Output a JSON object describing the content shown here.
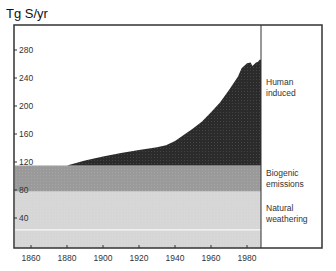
{
  "chart_data": {
    "type": "area",
    "title": "",
    "xlabel": "",
    "ylabel": "Tg S/yr",
    "xlim": [
      1851,
      1988
    ],
    "ylim": [
      0,
      300
    ],
    "x_ticks": [
      1860,
      1880,
      1900,
      1920,
      1940,
      1960,
      1980
    ],
    "y_ticks": [
      40,
      80,
      120,
      160,
      200,
      240,
      280
    ],
    "grid": false,
    "legend_position": "right, inline labels",
    "stacked": true,
    "series": [
      {
        "name": "Natural weathering",
        "color": "#d6d6d6",
        "x": [
          1851,
          1988
        ],
        "base": [
          0,
          0
        ],
        "top": [
          78,
          78
        ]
      },
      {
        "name": "Biogenic emissions",
        "color": "#9a9a9a",
        "x": [
          1851,
          1988
        ],
        "base": [
          78,
          78
        ],
        "top": [
          115,
          115
        ]
      },
      {
        "name": "Human induced",
        "color": "#2b2b2b",
        "x": [
          1880,
          1890,
          1900,
          1910,
          1920,
          1930,
          1935,
          1940,
          1950,
          1955,
          1960,
          1965,
          1970,
          1975,
          1977,
          1980,
          1982,
          1983,
          1985,
          1986,
          1987
        ],
        "total": [
          115,
          122,
          128,
          133,
          137,
          141,
          144,
          150,
          168,
          178,
          191,
          205,
          223,
          242,
          254,
          261,
          262,
          257,
          262,
          263,
          266
        ]
      }
    ],
    "annotations": [
      {
        "text": "Human induced",
        "lines": [
          "Human",
          "induced"
        ]
      },
      {
        "text": "Biogenic emissions",
        "lines": [
          "Biogenic",
          "emissions"
        ]
      },
      {
        "text": "Natural weathering",
        "lines": [
          "Natural",
          "weathering"
        ]
      }
    ],
    "reference_line": {
      "y": 23,
      "color": "#ffffff"
    }
  },
  "labels": {
    "y_unit": "Tg S/yr",
    "human_1": "Human",
    "human_2": "induced",
    "bio_1": "Biogenic",
    "bio_2": "emissions",
    "nat_1": "Natural",
    "nat_2": "weathering"
  },
  "ticks": {
    "x": [
      "1860",
      "1880",
      "1900",
      "1920",
      "1940",
      "1960",
      "1980"
    ],
    "y": [
      "280",
      "240",
      "200",
      "160",
      "120",
      "80",
      "40"
    ]
  },
  "colors": {
    "human": "#2b2b2b",
    "biogenic": "#9a9a9a",
    "natural": "#d6d6d6",
    "frame": "#333333"
  }
}
